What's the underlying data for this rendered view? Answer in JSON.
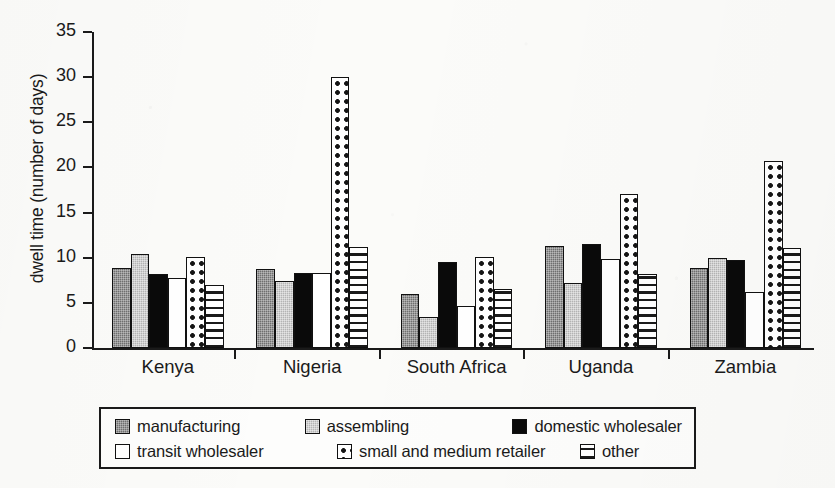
{
  "chart_data": {
    "type": "bar",
    "title": "",
    "xlabel": "",
    "ylabel": "dwell time (number of days)",
    "ylim": [
      0,
      35
    ],
    "yticks": [
      0,
      5,
      10,
      15,
      20,
      25,
      30,
      35
    ],
    "grid": false,
    "legend_position": "bottom",
    "categories": [
      "Kenya",
      "Nigeria",
      "South Africa",
      "Uganda",
      "Zambia"
    ],
    "series": [
      {
        "name": "manufacturing",
        "pattern": "dark-gray-dither",
        "color": "#6f6f6f",
        "values": [
          8.9,
          8.8,
          6.0,
          11.3,
          8.9
        ]
      },
      {
        "name": "assembling",
        "pattern": "light-gray-dither",
        "color": "#b4b4b4",
        "values": [
          10.4,
          7.4,
          3.4,
          7.2,
          10.0
        ]
      },
      {
        "name": "domestic wholesaler",
        "pattern": "solid-black",
        "color": "#0a0a0a",
        "values": [
          8.2,
          8.3,
          9.5,
          11.5,
          9.7
        ]
      },
      {
        "name": "transit wholesaler",
        "pattern": "white",
        "color": "#ffffff",
        "values": [
          7.7,
          8.3,
          4.7,
          9.9,
          6.2
        ]
      },
      {
        "name": "small and medium retailer",
        "pattern": "polka-dots",
        "color": "#ffffff",
        "values": [
          10.1,
          30.0,
          10.1,
          17.1,
          20.7
        ]
      },
      {
        "name": "other",
        "pattern": "horizontal-stripes",
        "color": "#ffffff",
        "values": [
          7.0,
          11.2,
          6.5,
          8.2,
          11.1
        ]
      }
    ]
  },
  "legend": {
    "rows": [
      [
        {
          "label": "manufacturing",
          "swatch": "manufacturing"
        },
        {
          "label": "assembling",
          "swatch": "assembling"
        },
        {
          "label": "domestic wholesaler",
          "swatch": "domestic"
        }
      ],
      [
        {
          "label": "transit wholesaler",
          "swatch": "transit"
        },
        {
          "label": "small and medium retailer",
          "swatch": "retailer"
        },
        {
          "label": "other",
          "swatch": "other"
        }
      ]
    ]
  }
}
